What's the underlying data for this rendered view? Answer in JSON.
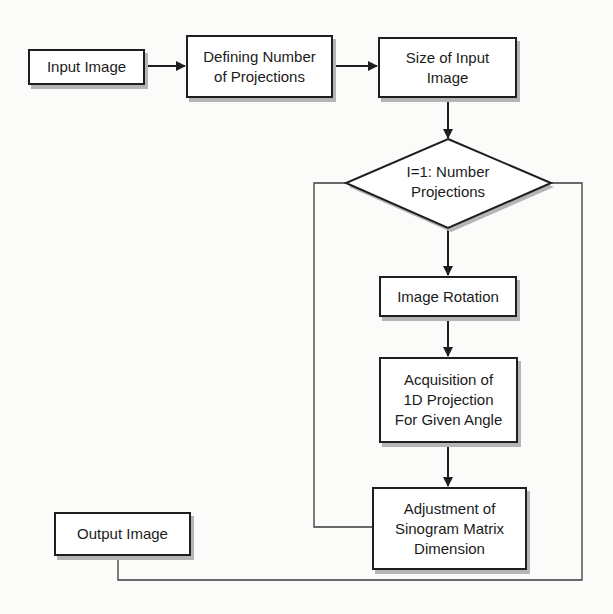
{
  "diagram": {
    "type": "flowchart",
    "nodes": {
      "input_image": {
        "label": "Input Image",
        "shape": "rectangle"
      },
      "defining_projections": {
        "label": "Defining Number\nof Projections",
        "shape": "rectangle"
      },
      "size_input_image": {
        "label": "Size of Input\nImage",
        "shape": "rectangle"
      },
      "loop_decision": {
        "label": "I=1: Number\nProjections",
        "shape": "diamond"
      },
      "image_rotation": {
        "label": "Image Rotation",
        "shape": "rectangle"
      },
      "acquisition": {
        "label": "Acquisition of\n1D Projection\nFor Given Angle",
        "shape": "rectangle"
      },
      "adjustment": {
        "label": "Adjustment of\nSinogram Matrix\nDimension",
        "shape": "rectangle"
      },
      "output_image": {
        "label": "Output Image",
        "shape": "rectangle"
      }
    },
    "edges": [
      {
        "from": "Input Image",
        "to": "Defining Number of Projections",
        "arrow": true
      },
      {
        "from": "Defining Number of Projections",
        "to": "Size of Input Image",
        "arrow": true
      },
      {
        "from": "Size of Input Image",
        "to": "I=1: Number Projections",
        "arrow": true
      },
      {
        "from": "I=1: Number Projections",
        "to": "Image Rotation",
        "arrow": true
      },
      {
        "from": "Image Rotation",
        "to": "Acquisition of 1D Projection For Given Angle",
        "arrow": true
      },
      {
        "from": "Acquisition of 1D Projection For Given Angle",
        "to": "Adjustment of Sinogram Matrix Dimension",
        "arrow": true
      },
      {
        "from": "Adjustment of Sinogram Matrix Dimension",
        "to": "I=1: Number Projections",
        "arrow": false,
        "route": "loop-back-left"
      },
      {
        "from": "I=1: Number Projections",
        "to": "Output Image",
        "arrow": false,
        "route": "exit-right-bottom"
      }
    ],
    "colors": {
      "stroke": "#1e1e1e",
      "fill": "#ffffff",
      "shadow": "#b5b5b5",
      "background": "#fbfbfa"
    }
  }
}
